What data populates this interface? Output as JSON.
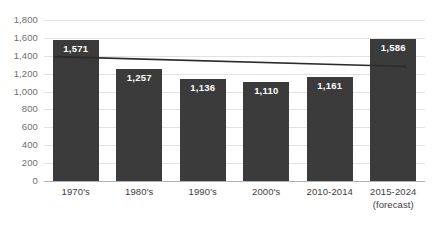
{
  "chart_data": {
    "type": "bar",
    "title": "",
    "subtitle": "",
    "xlabel": "",
    "ylabel": "",
    "categories": [
      "1970's",
      "1980's",
      "1990's",
      "2000's",
      "2010-2014",
      "2015-2024 (forecast)"
    ],
    "category_lines": [
      [
        "1970's"
      ],
      [
        "1980's"
      ],
      [
        "1990's"
      ],
      [
        "2000's"
      ],
      [
        "2010-2014"
      ],
      [
        "2015-2024",
        "(forecast)"
      ]
    ],
    "values": [
      1571,
      1257,
      1136,
      1110,
      1161,
      1586
    ],
    "value_labels": [
      "1,571",
      "1,257",
      "1,136",
      "1,110",
      "1,161",
      "1,586"
    ],
    "ylim": [
      0,
      1800
    ],
    "ytick_values": [
      0,
      200,
      400,
      600,
      800,
      1000,
      1200,
      1400,
      1600,
      1800
    ],
    "ytick_labels": [
      "0",
      "200",
      "400",
      "600",
      "800",
      "1,000",
      "1,200",
      "1,400",
      "1,600",
      "1,800"
    ],
    "grid": true,
    "legend": "none",
    "series": [
      {
        "name": "bars",
        "type": "bar",
        "color": "#3b3b3b",
        "values": [
          1571,
          1257,
          1136,
          1110,
          1161,
          1586
        ]
      },
      {
        "name": "trendline",
        "type": "line",
        "color": "#2b2b2b",
        "start_value": 1390,
        "end_value": 1280,
        "values": [
          1390,
          1368,
          1346,
          1324,
          1302,
          1280
        ]
      }
    ],
    "colors": {
      "bar": "#3b3b3b",
      "trendline": "#2b2b2b",
      "gridline": "#e2e2e2",
      "axis": "#b0b0b0",
      "label_text": "#ffffff",
      "tick_text": "#6e6e6e",
      "category_text": "#3d3d3d",
      "background": "#ffffff"
    }
  }
}
